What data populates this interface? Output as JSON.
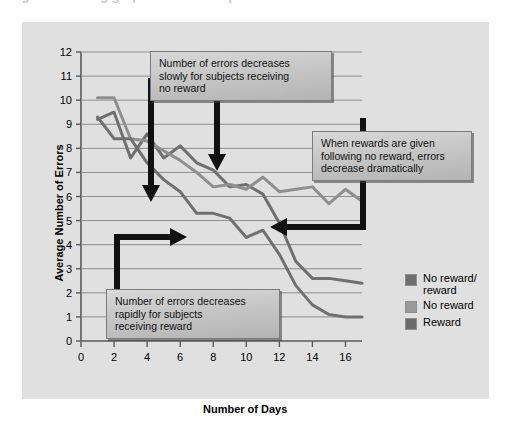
{
  "figure": {
    "background_color": "#e0e0e0",
    "page_background": "#ffffff",
    "cutoff_header_text": "Figure  Learning graph of reward experiment"
  },
  "chart_data": {
    "type": "line",
    "title": "",
    "xlabel": "Number of Days",
    "ylabel": "Average Number of Errors",
    "xlim": [
      0,
      17
    ],
    "ylim": [
      0,
      12
    ],
    "xticks": [
      0,
      2,
      4,
      6,
      8,
      10,
      12,
      14,
      16
    ],
    "yticks": [
      0,
      1,
      2,
      3,
      4,
      5,
      6,
      7,
      8,
      9,
      10,
      11,
      12
    ],
    "grid": "horizontal",
    "legend_position": "right",
    "x": [
      1,
      2,
      3,
      4,
      5,
      6,
      7,
      8,
      9,
      10,
      11,
      12,
      13,
      14,
      15,
      16,
      17
    ],
    "series": [
      {
        "name": "No reward/reward",
        "color": "#6f6f6f",
        "values": [
          9.2,
          9.5,
          7.6,
          8.6,
          7.6,
          8.1,
          7.4,
          7.1,
          6.4,
          6.5,
          6.1,
          4.9,
          3.3,
          2.6,
          2.6,
          2.5,
          2.4
        ]
      },
      {
        "name": "No reward",
        "color": "#8f8f8f",
        "values": [
          10.1,
          10.1,
          8.4,
          8.3,
          7.9,
          7.5,
          7.0,
          6.4,
          6.5,
          6.3,
          6.8,
          6.2,
          6.3,
          6.4,
          5.7,
          6.3,
          5.8
        ]
      },
      {
        "name": "Reward",
        "color": "#707070",
        "values": [
          9.3,
          8.4,
          8.4,
          7.4,
          6.7,
          6.2,
          5.3,
          5.3,
          5.1,
          4.3,
          4.6,
          3.6,
          2.3,
          1.5,
          1.1,
          1.0,
          1.0
        ]
      }
    ],
    "annotations": [
      {
        "name": "no-reward-callout",
        "text": "Number of errors decreases slowly for subjects receiving no reward",
        "lines": [
          "Number of errors decreases",
          "slowly for subjects receiving",
          "no reward"
        ],
        "arrows": [
          "down",
          "down"
        ]
      },
      {
        "name": "rewards-given-callout",
        "text": "When rewards are given following no reward, errors decrease dramatically",
        "lines": [
          "When rewards are given",
          "following no reward, errors",
          "decrease dramatically"
        ],
        "arrows": [
          "left"
        ]
      },
      {
        "name": "reward-callout",
        "text": "Number of errors decreases rapidly for subjects receiving reward",
        "lines": [
          "Number of errors decreases",
          "rapidly for subjects",
          "receiving reward"
        ],
        "arrows": [
          "right"
        ]
      }
    ]
  },
  "legend": {
    "items": [
      {
        "label_line1": "No reward/",
        "label_line2": "reward",
        "color": "#6f6f6f"
      },
      {
        "label_line1": "No reward",
        "label_line2": "",
        "color": "#9a9a9a"
      },
      {
        "label_line1": "Reward",
        "label_line2": "",
        "color": "#6a6a6a"
      }
    ]
  },
  "axes": {
    "x_title": "Number of Days",
    "y_title": "Average Number of Errors",
    "x_tick_labels": [
      "0",
      "2",
      "4",
      "6",
      "8",
      "10",
      "12",
      "14",
      "16"
    ],
    "y_tick_labels": [
      "0",
      "1",
      "2",
      "3",
      "4",
      "5",
      "6",
      "7",
      "8",
      "9",
      "10",
      "11",
      "12"
    ]
  }
}
